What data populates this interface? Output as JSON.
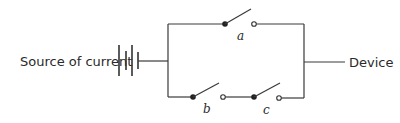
{
  "diagram": {
    "type": "circuit",
    "labels": {
      "source": "Source of current",
      "device": "Device",
      "switch_a": "a",
      "switch_b": "b",
      "switch_c": "c"
    },
    "components": [
      {
        "id": "battery",
        "kind": "battery",
        "label": "Source of current"
      },
      {
        "id": "a",
        "kind": "switch",
        "state": "open",
        "branch": "top"
      },
      {
        "id": "b",
        "kind": "switch",
        "state": "open",
        "branch": "bottom"
      },
      {
        "id": "c",
        "kind": "switch",
        "state": "open",
        "branch": "bottom"
      },
      {
        "id": "device",
        "kind": "load",
        "label": "Device"
      }
    ],
    "topology": "Switch a in parallel with series pair (b, c), between source and device",
    "colors": {
      "line": "#3a3a3a",
      "text": "#2a2a2a",
      "background": "#ffffff"
    }
  }
}
